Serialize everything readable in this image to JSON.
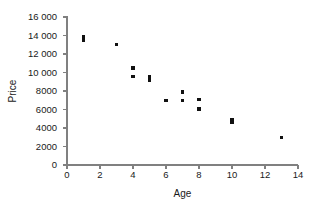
{
  "chart_data": {
    "type": "scatter",
    "title": "",
    "xlabel": "Age",
    "ylabel": "Price",
    "xlim": [
      0,
      14
    ],
    "ylim": [
      0,
      16000
    ],
    "grid": false,
    "legend": null,
    "x_ticks": [
      0,
      2,
      4,
      6,
      8,
      10,
      12,
      14
    ],
    "x_tick_labels": [
      "0",
      "2",
      "4",
      "6",
      "8",
      "10",
      "12",
      "14"
    ],
    "y_ticks": [
      0,
      2000,
      4000,
      6000,
      8000,
      10000,
      12000,
      14000,
      16000
    ],
    "y_tick_labels": [
      "0",
      "2000",
      "4000",
      "6000",
      "8000",
      "10 000",
      "12 000",
      "14 000",
      "16 000"
    ],
    "marker": "square",
    "marker_color": "#111111",
    "axis_color": "#808080",
    "background_color": "#ffffff",
    "points": [
      {
        "x": 1,
        "y": 13900
      },
      {
        "x": 1,
        "y": 13500
      },
      {
        "x": 3,
        "y": 13000
      },
      {
        "x": 4,
        "y": 10500
      },
      {
        "x": 4,
        "y": 9550
      },
      {
        "x": 5,
        "y": 9500
      },
      {
        "x": 5,
        "y": 9150
      },
      {
        "x": 6,
        "y": 7000
      },
      {
        "x": 7,
        "y": 7900
      },
      {
        "x": 7,
        "y": 7000
      },
      {
        "x": 8,
        "y": 7050
      },
      {
        "x": 8,
        "y": 6050
      },
      {
        "x": 10,
        "y": 4950
      },
      {
        "x": 10,
        "y": 4650
      },
      {
        "x": 13,
        "y": 3000
      }
    ]
  },
  "geometry": {
    "plot_left": 67,
    "plot_right": 298,
    "plot_top": 17,
    "plot_bottom": 165,
    "tick_len": 4,
    "marker_size": 3.4,
    "y_label_x": 57,
    "y_title_x": 16,
    "y_title_y": 91,
    "x_label_y": 178,
    "x_title_y": 197
  }
}
